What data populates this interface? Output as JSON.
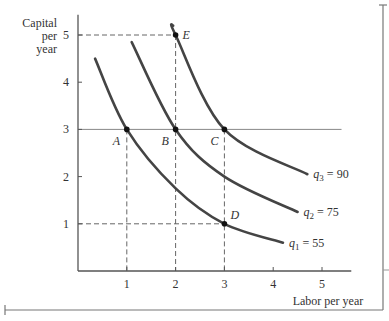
{
  "chart_data": {
    "type": "line",
    "title": "",
    "xlabel": "Labor per year",
    "ylabel": "Capital per year",
    "ylabel_lines": [
      "Capital",
      "per",
      "year"
    ],
    "xlim": [
      0,
      5.5
    ],
    "ylim": [
      0,
      5.3
    ],
    "x_ticks": [
      "1",
      "2",
      "3",
      "4",
      "5"
    ],
    "y_ticks": [
      "1",
      "2",
      "3",
      "4",
      "5"
    ],
    "grid": false,
    "series": [
      {
        "name": "q1 = 55",
        "label_base": "q",
        "label_sub": "1",
        "label_value": "= 55",
        "x": [
          0.35,
          1,
          2,
          3,
          4.2
        ],
        "y": [
          4.5,
          3,
          1.75,
          1,
          0.6
        ]
      },
      {
        "name": "q2 = 75",
        "label_base": "q",
        "label_sub": "2",
        "label_value": "= 75",
        "x": [
          1.1,
          2,
          3,
          4.5
        ],
        "y": [
          4.85,
          3,
          2.0,
          1.25
        ]
      },
      {
        "name": "q3 = 90",
        "label_base": "q",
        "label_sub": "3",
        "label_value": "= 90",
        "x": [
          1.95,
          2,
          3,
          4.7
        ],
        "y": [
          5.2,
          5,
          3,
          2.05
        ]
      }
    ],
    "points": [
      {
        "label": "A",
        "x": 1,
        "y": 3
      },
      {
        "label": "B",
        "x": 2,
        "y": 3
      },
      {
        "label": "C",
        "x": 3,
        "y": 3
      },
      {
        "label": "D",
        "x": 3,
        "y": 1
      },
      {
        "label": "E",
        "x": 2,
        "y": 5
      }
    ],
    "reference_lines": [
      {
        "type": "horizontal",
        "y": 3,
        "style": "solid"
      },
      {
        "type": "dashed",
        "from": [
          0,
          5
        ],
        "to": [
          2,
          5
        ]
      },
      {
        "type": "dashed",
        "from": [
          2,
          5
        ],
        "to": [
          2,
          0
        ]
      },
      {
        "type": "dashed",
        "from": [
          1,
          3
        ],
        "to": [
          1,
          0
        ]
      },
      {
        "type": "dashed",
        "from": [
          3,
          3
        ],
        "to": [
          3,
          0
        ]
      },
      {
        "type": "dashed",
        "from": [
          0,
          1
        ],
        "to": [
          3,
          1
        ]
      }
    ]
  },
  "colors": {
    "curve": "#444444",
    "axis": "#555555",
    "dash": "#666666",
    "text": "#333333"
  }
}
